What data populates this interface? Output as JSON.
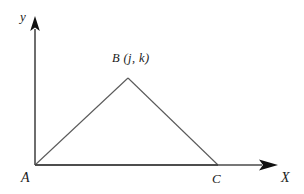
{
  "figure": {
    "type": "geometry-diagram",
    "background_color": "#ffffff",
    "axis_color": "#4a4a4a",
    "triangle_color": "#555555",
    "label_color": "#1a1a1a",
    "axes": {
      "x_axis_label": "X",
      "y_axis_label": "y",
      "x_arrow_icon": "arrow-right-solid",
      "y_arrow_icon": "arrow-up-solid",
      "origin": {
        "x": 35,
        "y": 165
      },
      "x_axis_end": {
        "x": 277,
        "y": 165
      },
      "y_axis_end": {
        "x": 35,
        "y": 18
      }
    },
    "triangle": {
      "vertices": [
        {
          "name": "A",
          "label": "A",
          "x": 35,
          "y": 165
        },
        {
          "name": "B",
          "label": "B (j, k)",
          "x": 128,
          "y": 78
        },
        {
          "name": "C",
          "label": "C",
          "x": 218,
          "y": 165
        }
      ],
      "vertex_a_label": "A",
      "vertex_b_label": "B (j, k)",
      "vertex_c_label": "C",
      "filled": false
    }
  }
}
